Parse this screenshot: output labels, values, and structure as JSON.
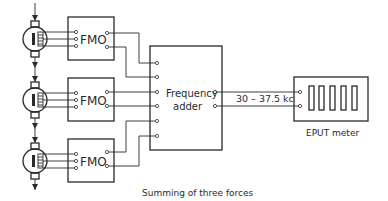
{
  "diagram": {
    "caption": "Summing of three forces",
    "transducers": [
      {
        "id": "transducer-1",
        "cy": 39
      },
      {
        "id": "transducer-2",
        "cy": 100
      },
      {
        "id": "transducer-3",
        "cy": 161
      }
    ],
    "fmo_blocks": [
      {
        "label": "FMO",
        "y": 17
      },
      {
        "label": "FMO",
        "y": 78
      },
      {
        "label": "FMO",
        "y": 139
      }
    ],
    "adder": {
      "line1": "Frequency",
      "line2": "adder"
    },
    "link_label": "30 – 37.5 kc",
    "meter": {
      "label": "EPUT meter",
      "digit_count": 5
    }
  }
}
